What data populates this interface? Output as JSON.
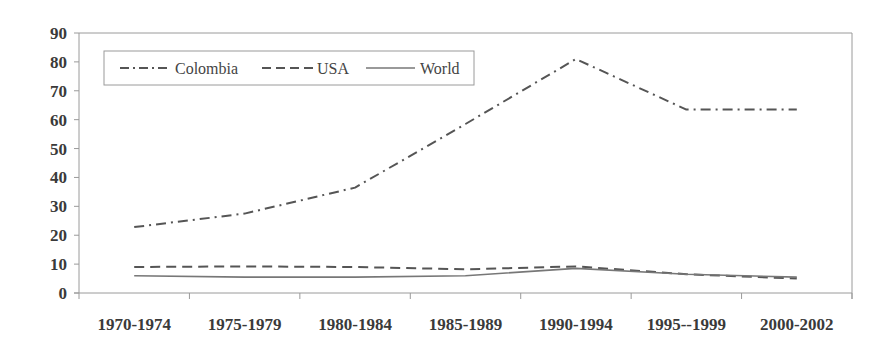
{
  "chart_data": {
    "type": "line",
    "title": "",
    "xlabel": "",
    "ylabel": "",
    "categories": [
      "1970-1974",
      "1975-1979",
      "1980-1984",
      "1985-1989",
      "1990-1994",
      "1995--1999",
      "2000-2002"
    ],
    "series": [
      {
        "name": "Colombia",
        "style": "dash-dot",
        "values": [
          22.8,
          27.5,
          36.5,
          58.5,
          81.0,
          63.5,
          63.5
        ]
      },
      {
        "name": "USA",
        "style": "dashed",
        "values": [
          9.0,
          9.2,
          9.0,
          8.2,
          9.2,
          6.5,
          5.0
        ]
      },
      {
        "name": "World",
        "style": "solid",
        "values": [
          6.0,
          5.5,
          5.5,
          6.0,
          8.5,
          6.5,
          5.5
        ]
      }
    ],
    "ylim": [
      0,
      90
    ],
    "yticks": [
      0,
      10,
      20,
      30,
      40,
      50,
      60,
      70,
      80,
      90
    ],
    "grid": false,
    "legend_position": "top-left inside",
    "colors": {
      "line": "#555555",
      "axis": "#9a9a9a",
      "text": "#3a3a3a"
    }
  },
  "legend": {
    "items": [
      {
        "label": "Colombia"
      },
      {
        "label": "USA"
      },
      {
        "label": "World"
      }
    ]
  }
}
